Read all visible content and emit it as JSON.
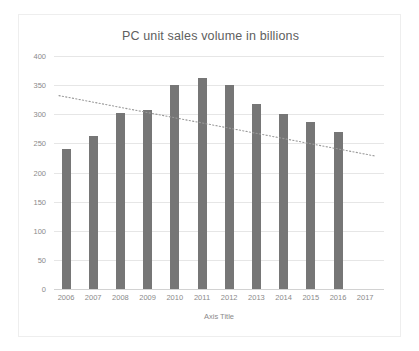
{
  "chart_data": {
    "type": "bar",
    "title": "PC unit sales volume in billions",
    "xlabel": "Axis Title",
    "ylabel": "",
    "categories": [
      "2006",
      "2007",
      "2008",
      "2009",
      "2010",
      "2011",
      "2012",
      "2013",
      "2014",
      "2015",
      "2016",
      "2017"
    ],
    "values": [
      240,
      263,
      302,
      307,
      350,
      363,
      351,
      317,
      301,
      287,
      269,
      null
    ],
    "ylim": [
      0,
      400
    ],
    "yticks": [
      0,
      50,
      100,
      150,
      200,
      250,
      300,
      350,
      400
    ],
    "ytick_labels": [
      "0",
      "50",
      "100",
      "150",
      "200",
      "250",
      "300",
      "350",
      "400"
    ],
    "grid": true,
    "legend": false,
    "series": [
      {
        "name": "PC unit sales volume",
        "type": "bar",
        "color": "#767676",
        "values": [
          240,
          263,
          302,
          307,
          350,
          363,
          351,
          317,
          301,
          287,
          269,
          null
        ]
      },
      {
        "name": "Linear trendline",
        "type": "line",
        "style": "dotted",
        "color": "#9a9a9a",
        "x": [
          "2006",
          "2017"
        ],
        "values": [
          332,
          228
        ]
      }
    ]
  },
  "colors": {
    "bar": "#767676",
    "trendline": "#9a9a9a",
    "gridline": "#e6e6e6",
    "axis": "#d2d2d2",
    "text": "#8a8a8a",
    "title_text": "#606060",
    "frame_border": "#eeeeee",
    "background": "#ffffff"
  }
}
